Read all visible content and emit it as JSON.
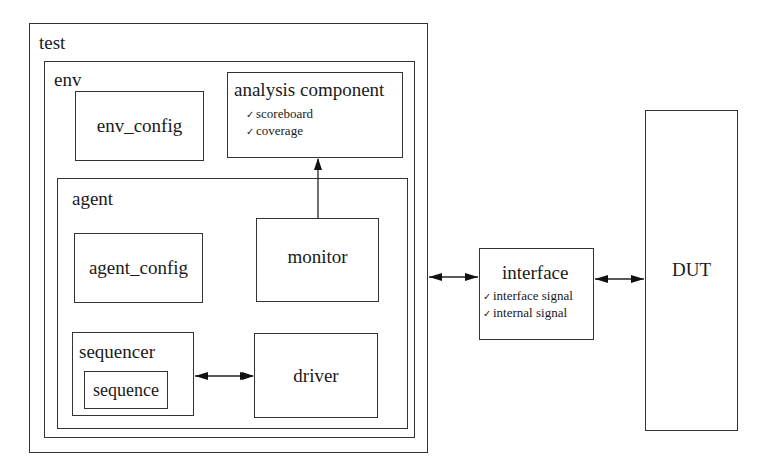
{
  "diagram": {
    "test": {
      "label": "test"
    },
    "env": {
      "label": "env"
    },
    "env_config": {
      "label": "env_config"
    },
    "analysis_component": {
      "label": "analysis component",
      "items": [
        "scoreboard",
        "coverage"
      ]
    },
    "agent": {
      "label": "agent"
    },
    "agent_config": {
      "label": "agent_config"
    },
    "monitor": {
      "label": "monitor"
    },
    "sequencer": {
      "label": "sequencer"
    },
    "sequence": {
      "label": "sequence"
    },
    "driver": {
      "label": "driver"
    },
    "interface": {
      "label": "interface",
      "items": [
        "interface signal",
        "internal signal"
      ]
    },
    "dut": {
      "label": "DUT"
    },
    "check_glyph": "✓",
    "connections": [
      {
        "from": "monitor",
        "to": "analysis component",
        "type": "one-way"
      },
      {
        "from": "sequencer",
        "to": "driver",
        "type": "bidirectional"
      },
      {
        "from": "test",
        "to": "interface",
        "type": "bidirectional"
      },
      {
        "from": "interface",
        "to": "DUT",
        "type": "bidirectional"
      }
    ]
  }
}
